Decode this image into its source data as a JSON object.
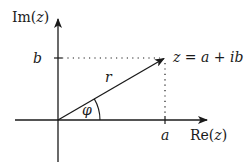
{
  "diagram": {
    "axes": {
      "vertical_label_prefix": "Im(",
      "vertical_label_var": "z",
      "vertical_label_suffix": ")",
      "horizontal_label_prefix": "Re(",
      "horizontal_label_var": "z",
      "horizontal_label_suffix": ")"
    },
    "labels": {
      "b": "b",
      "a": "a",
      "r": "r",
      "phi": "φ",
      "point": "z = a + ib"
    },
    "colors": {
      "line": "#1a1a1a",
      "background": "#ffffff"
    }
  }
}
